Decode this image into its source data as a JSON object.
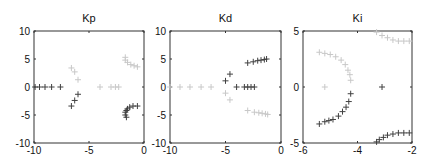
{
  "chart_data": [
    {
      "type": "scatter",
      "title": "Kp",
      "xlabel": "",
      "ylabel": "",
      "xlim": [
        -10,
        0
      ],
      "ylim": [
        -10,
        10
      ],
      "xticks": [
        -10,
        -5,
        0
      ],
      "yticks": [
        -10,
        -5,
        0,
        5,
        10
      ],
      "grid": false,
      "legend": null,
      "marker": "+",
      "series": [
        {
          "name": "light",
          "color": "#c8c8c8",
          "points": [
            [
              -6.6,
              3.4
            ],
            [
              -6.3,
              2.7
            ],
            [
              -6.0,
              1.3
            ],
            [
              -4.0,
              0
            ],
            [
              -3.0,
              0
            ],
            [
              -2.6,
              0
            ],
            [
              -2.3,
              0
            ],
            [
              -1.7,
              5.3
            ],
            [
              -1.7,
              4.8
            ],
            [
              -1.5,
              4.4
            ],
            [
              -1.2,
              4.0
            ],
            [
              -0.9,
              3.8
            ],
            [
              -0.6,
              3.6
            ]
          ]
        },
        {
          "name": "dark",
          "color": "#404040",
          "points": [
            [
              -9.9,
              0
            ],
            [
              -9.5,
              0
            ],
            [
              -9.0,
              0
            ],
            [
              -8.4,
              0
            ],
            [
              -7.6,
              0
            ],
            [
              -6.0,
              -1.3
            ],
            [
              -6.3,
              -2.4
            ],
            [
              -6.6,
              -3.4
            ],
            [
              -1.7,
              -4.5
            ],
            [
              -1.7,
              -5.0
            ],
            [
              -1.6,
              -5.4
            ],
            [
              -1.6,
              -4.2
            ],
            [
              -1.5,
              -3.9
            ],
            [
              -1.3,
              -3.6
            ],
            [
              -1.0,
              -3.4
            ],
            [
              -0.6,
              -3.4
            ]
          ]
        }
      ]
    },
    {
      "type": "scatter",
      "title": "Kd",
      "xlabel": "",
      "ylabel": "",
      "xlim": [
        -10,
        0
      ],
      "ylim": [
        -10,
        10
      ],
      "xticks": [
        -10,
        -5,
        0
      ],
      "yticks": [
        -10,
        -5,
        0,
        5,
        10
      ],
      "grid": false,
      "legend": null,
      "marker": "+",
      "series": [
        {
          "name": "light",
          "color": "#c8c8c8",
          "points": [
            [
              -10.0,
              0
            ],
            [
              -9.1,
              0
            ],
            [
              -8.2,
              0
            ],
            [
              -7.2,
              0
            ],
            [
              -6.3,
              0
            ],
            [
              -5.0,
              -1.1
            ],
            [
              -4.6,
              -2.3
            ],
            [
              -3.0,
              -4.2
            ],
            [
              -2.4,
              -4.5
            ],
            [
              -2.0,
              -4.6
            ],
            [
              -1.7,
              -4.7
            ],
            [
              -1.4,
              -4.8
            ],
            [
              -1.2,
              -4.9
            ]
          ]
        },
        {
          "name": "dark",
          "color": "#404040",
          "points": [
            [
              -5.0,
              1.1
            ],
            [
              -4.6,
              2.3
            ],
            [
              -4.0,
              0
            ],
            [
              -3.3,
              0
            ],
            [
              -3.0,
              0
            ],
            [
              -2.7,
              0
            ],
            [
              -2.4,
              0
            ],
            [
              -3.0,
              4.3
            ],
            [
              -2.5,
              4.5
            ],
            [
              -2.1,
              4.7
            ],
            [
              -1.8,
              4.8
            ],
            [
              -1.5,
              4.9
            ],
            [
              -1.3,
              5.0
            ]
          ]
        }
      ]
    },
    {
      "type": "scatter",
      "title": "Ki",
      "xlabel": "",
      "ylabel": "",
      "xlim": [
        -6,
        -2
      ],
      "ylim": [
        -5,
        5
      ],
      "xticks": [
        -6,
        -4,
        -2
      ],
      "yticks": [
        -5,
        0,
        5
      ],
      "grid": false,
      "legend": null,
      "marker": "+",
      "series": [
        {
          "name": "light",
          "color": "#c8c8c8",
          "points": [
            [
              -5.4,
              3.1
            ],
            [
              -5.2,
              3.0
            ],
            [
              -5.0,
              2.9
            ],
            [
              -4.8,
              2.7
            ],
            [
              -4.6,
              2.4
            ],
            [
              -4.45,
              2.0
            ],
            [
              -4.35,
              1.5
            ],
            [
              -4.28,
              1.1
            ],
            [
              -4.25,
              0.6
            ],
            [
              -5.2,
              0
            ],
            [
              -3.3,
              4.9
            ],
            [
              -3.1,
              4.6
            ],
            [
              -2.9,
              4.4
            ],
            [
              -2.7,
              4.2
            ],
            [
              -2.5,
              4.1
            ],
            [
              -2.3,
              4.1
            ],
            [
              -2.1,
              4.1
            ]
          ]
        },
        {
          "name": "dark",
          "color": "#404040",
          "points": [
            [
              -3.1,
              0
            ],
            [
              -4.25,
              -0.6
            ],
            [
              -4.32,
              -1.3
            ],
            [
              -4.42,
              -1.8
            ],
            [
              -4.55,
              -2.2
            ],
            [
              -4.7,
              -2.6
            ],
            [
              -4.9,
              -2.9
            ],
            [
              -5.05,
              -3.0
            ],
            [
              -5.2,
              -3.1
            ],
            [
              -5.4,
              -3.3
            ],
            [
              -3.3,
              -4.9
            ],
            [
              -3.2,
              -4.7
            ],
            [
              -3.05,
              -4.5
            ],
            [
              -2.9,
              -4.3
            ],
            [
              -2.7,
              -4.2
            ],
            [
              -2.5,
              -4.1
            ],
            [
              -2.3,
              -4.1
            ],
            [
              -2.1,
              -4.1
            ]
          ]
        }
      ]
    }
  ]
}
